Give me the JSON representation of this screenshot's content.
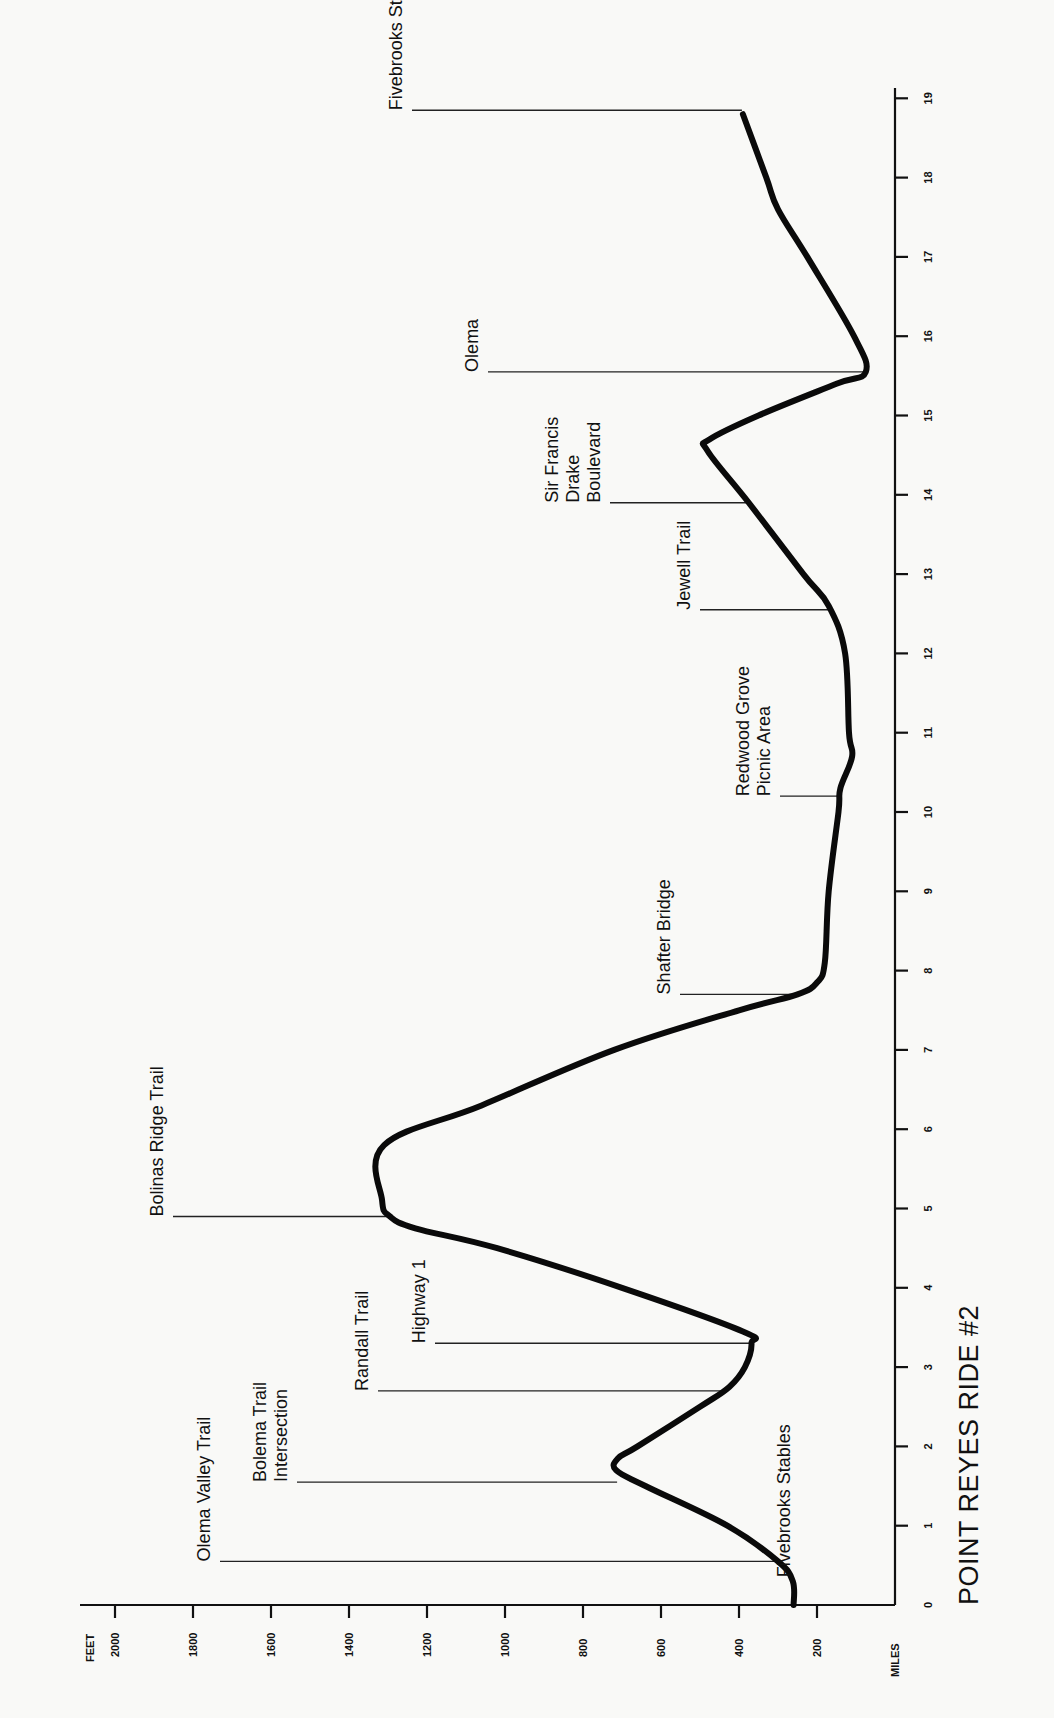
{
  "chart_data": {
    "type": "line",
    "title": "POINT REYES RIDE #2",
    "xlabel": "MILES",
    "ylabel": "FEET",
    "orientation": "rotated -90deg (miles run bottom-to-top, elevation runs right-to-left)",
    "xlim": [
      0,
      19
    ],
    "ylim": [
      0,
      2000
    ],
    "x_ticks": [
      0,
      1,
      2,
      3,
      4,
      5,
      6,
      7,
      8,
      9,
      10,
      11,
      12,
      13,
      14,
      15,
      16,
      17,
      18,
      19
    ],
    "y_ticks": [
      200,
      400,
      600,
      800,
      1000,
      1200,
      1400,
      1600,
      1800,
      2000
    ],
    "grid": false,
    "series": [
      {
        "name": "Elevation profile",
        "points": [
          [
            0,
            260
          ],
          [
            0.3,
            262
          ],
          [
            0.55,
            300
          ],
          [
            1.0,
            430
          ],
          [
            1.5,
            640
          ],
          [
            1.7,
            715
          ],
          [
            1.85,
            710
          ],
          [
            2.0,
            660
          ],
          [
            2.5,
            500
          ],
          [
            2.75,
            425
          ],
          [
            3.0,
            385
          ],
          [
            3.3,
            368
          ],
          [
            3.45,
            390
          ],
          [
            4.0,
            700
          ],
          [
            4.5,
            1020
          ],
          [
            4.75,
            1230
          ],
          [
            4.9,
            1295
          ],
          [
            5.1,
            1315
          ],
          [
            5.8,
            1310
          ],
          [
            6.3,
            1060
          ],
          [
            7.0,
            720
          ],
          [
            7.5,
            400
          ],
          [
            7.7,
            250
          ],
          [
            7.85,
            200
          ],
          [
            8.1,
            180
          ],
          [
            9.0,
            170
          ],
          [
            10.0,
            145
          ],
          [
            10.3,
            140
          ],
          [
            10.7,
            110
          ],
          [
            11.0,
            118
          ],
          [
            12.0,
            128
          ],
          [
            12.6,
            170
          ],
          [
            13.0,
            235
          ],
          [
            13.9,
            375
          ],
          [
            14.55,
            480
          ],
          [
            14.7,
            475
          ],
          [
            15.0,
            350
          ],
          [
            15.4,
            150
          ],
          [
            15.55,
            75
          ],
          [
            16.0,
            105
          ],
          [
            17.0,
            225
          ],
          [
            17.6,
            300
          ],
          [
            18.0,
            330
          ],
          [
            18.8,
            390
          ]
        ]
      }
    ],
    "annotations": [
      {
        "label": "Fivebrooks Stables",
        "mile": 0.4,
        "elevation": 265
      },
      {
        "label": "Olema Valley Trail",
        "mile": 0.55,
        "elevation": 300
      },
      {
        "label": "Bolema Trail Intersection",
        "mile": 1.55,
        "elevation": 710
      },
      {
        "label": "Randall Trail",
        "mile": 2.7,
        "elevation": 430
      },
      {
        "label": "Highway 1",
        "mile": 3.3,
        "elevation": 370
      },
      {
        "label": "Bolinas Ridge Trail",
        "mile": 4.9,
        "elevation": 1300
      },
      {
        "label": "Shafter Bridge",
        "mile": 7.7,
        "elevation": 250
      },
      {
        "label": "Redwood Grove Picnic Area",
        "mile": 10.2,
        "elevation": 140
      },
      {
        "label": "Jewell Trail",
        "mile": 12.55,
        "elevation": 165
      },
      {
        "label": "Sir Francis Drake Boulevard",
        "mile": 13.9,
        "elevation": 375
      },
      {
        "label": "Olema",
        "mile": 15.55,
        "elevation": 75
      },
      {
        "label": "Fivebrooks Stables",
        "mile": 18.85,
        "elevation": 390
      }
    ]
  },
  "labels": {
    "title": "POINT REYES RIDE #2",
    "feet_axis": "FEET",
    "miles_axis": "MILES",
    "landmarks": [
      {
        "lines": [
          "Fivebrooks Stables"
        ],
        "mile": 0.4,
        "elevation": 265,
        "label_x": 790,
        "label_mile": 0.35,
        "leader_to_x": null
      },
      {
        "lines": [
          "Olema Valley Trail"
        ],
        "mile": 0.55,
        "elevation": 300,
        "label_x": 210
      },
      {
        "lines": [
          "Bolema Trail",
          "Intersection"
        ],
        "mile": 1.55,
        "elevation": 710,
        "label_x": 287
      },
      {
        "lines": [
          "Randall Trail"
        ],
        "mile": 2.7,
        "elevation": 430,
        "label_x": 368
      },
      {
        "lines": [
          "Highway 1"
        ],
        "mile": 3.3,
        "elevation": 370,
        "label_x": 425
      },
      {
        "lines": [
          "Bolinas Ridge Trail"
        ],
        "mile": 4.9,
        "elevation": 1300,
        "label_x": 163
      },
      {
        "lines": [
          "Shafter Bridge"
        ],
        "mile": 7.7,
        "elevation": 250,
        "label_x": 670
      },
      {
        "lines": [
          "Redwood Grove",
          "Picnic Area"
        ],
        "mile": 10.2,
        "elevation": 140,
        "label_x": 770
      },
      {
        "lines": [
          "Jewell Trail"
        ],
        "mile": 12.55,
        "elevation": 168,
        "label_x": 690
      },
      {
        "lines": [
          "Sir Francis",
          "Drake",
          "Boulevard"
        ],
        "mile": 13.9,
        "elevation": 375,
        "label_x": 600
      },
      {
        "lines": [
          "Olema"
        ],
        "mile": 15.55,
        "elevation": 75,
        "label_x": 478
      },
      {
        "lines": [
          "Fivebrooks Stables"
        ],
        "mile": 18.85,
        "elevation": 390,
        "label_x": 402
      }
    ]
  }
}
